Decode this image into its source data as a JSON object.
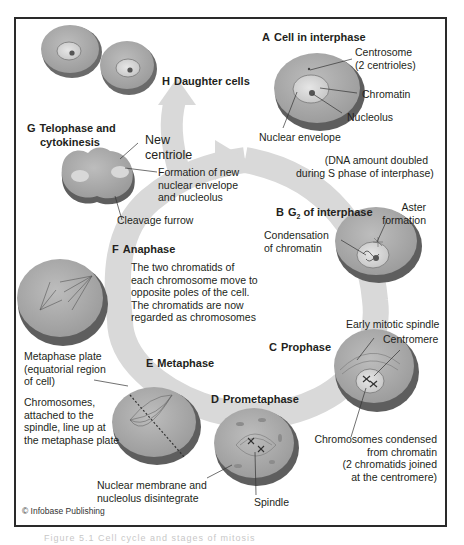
{
  "diagram": {
    "type": "cell-cycle / mitosis diagram",
    "colors": {
      "cycle_arrow": "#d6d6d6",
      "cell_fill": "#a7a7a7",
      "cell_edge": "#5f5f5f",
      "nucleus_fill": "#d2d2d2",
      "frame": "#2a2a2a"
    },
    "stages": {
      "A": {
        "letter": "A",
        "title": "Cell in interphase"
      },
      "B": {
        "letter": "B",
        "title_pre": "G",
        "title_sub": "2",
        "title_post": " of interphase"
      },
      "C": {
        "letter": "C",
        "title": "Prophase"
      },
      "D": {
        "letter": "D",
        "title": "Prometaphase"
      },
      "E": {
        "letter": "E",
        "title": "Metaphase"
      },
      "F": {
        "letter": "F",
        "title": "Anaphase"
      },
      "G": {
        "letter": "G",
        "title_line1": "Telophase and",
        "title_line2": "cytokinesis"
      },
      "H": {
        "letter": "H",
        "title": "Daughter cells"
      }
    },
    "labels": {
      "centrosome": "Centrosome\n(2 centrioles)",
      "chromatin": "Chromatin",
      "nucleolus": "Nucleolus",
      "nuclear_envelope": "Nuclear envelope",
      "dna_note": "(DNA amount doubled\nduring S phase of interphase)",
      "aster_formation": "Aster\nformation",
      "condensation": "Condensation\nof chromatin",
      "early_spindle": "Early mitotic spindle",
      "centromere": "Centromere",
      "chromosomes_condensed": "Chromosomes condensed\nfrom chromatin\n(2 chromatids joined\nat the centromere)",
      "spindle": "Spindle",
      "nuclear_membrane": "Nuclear membrane and\nnucleolus disintegrate",
      "metaphase_plate": "Metaphase plate\n(equatorial region\nof cell)",
      "chromosomes_line_up": "Chromosomes,\nattached to the\nspindle, line up at\nthe metaphase plate",
      "anaphase_desc": "The two chromatids of\neach chromosome move to\nopposite poles of the cell.\nThe chromatids are now\nregarded as chromosomes",
      "new_centriole": "New\ncentriole",
      "new_envelope": "Formation of new\nnuclear envelope\nand nucleolus",
      "cleavage_furrow": "Cleavage furrow"
    },
    "credit": "© Infobase Publishing",
    "caption_cutoff": "Figure 5.1 Cell cycle and stages of mitosis"
  }
}
